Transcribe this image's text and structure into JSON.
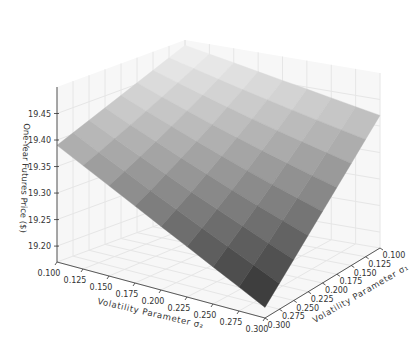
{
  "chart_data": {
    "type": "surface3d",
    "title": "",
    "xlabel": "Volatility Parameter σ₂",
    "ylabel": "Volatility Parameter σ₁",
    "zlabel": "One-Year Futures Price ($)",
    "x_ticks": [
      "0.100",
      "0.125",
      "0.150",
      "0.175",
      "0.200",
      "0.225",
      "0.250",
      "0.275",
      "0.300"
    ],
    "y_ticks": [
      "0.100",
      "0.125",
      "0.150",
      "0.175",
      "0.200",
      "0.225",
      "0.250",
      "0.275",
      "0.300"
    ],
    "z_ticks": [
      "19.20",
      "19.25",
      "19.30",
      "19.35",
      "19.40",
      "19.45"
    ],
    "zlim": [
      19.17,
      19.5
    ],
    "x": [
      0.1,
      0.125,
      0.15,
      0.175,
      0.2,
      0.225,
      0.25,
      0.275,
      0.3
    ],
    "y": [
      0.1,
      0.125,
      0.15,
      0.175,
      0.2,
      0.225,
      0.25,
      0.275,
      0.3
    ],
    "corner_values": {
      "x0.100_y0.100": 19.49,
      "x0.300_y0.100": 19.42,
      "x0.100_y0.300": 19.39,
      "x0.300_y0.300": 19.19
    },
    "colormap": "gray",
    "grid": true
  }
}
